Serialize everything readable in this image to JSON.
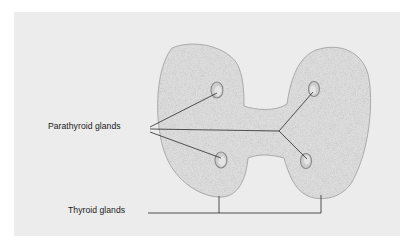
{
  "diagram": {
    "labels": {
      "parathyroid": "Parathyroid glands",
      "thyroid": "Thyroid glands"
    },
    "colors": {
      "background": "#ffffff",
      "panel": "#ececec",
      "lobe_fill": "#dedede",
      "lobe_stroke": "#9a9a9a",
      "parathyroid_fill": "#cfcfcf",
      "parathyroid_stroke": "#8a8a8a",
      "leader_line": "#2a2a2a"
    },
    "structures": [
      {
        "name": "left-thyroid-lobe",
        "type": "thyroid"
      },
      {
        "name": "right-thyroid-lobe",
        "type": "thyroid"
      },
      {
        "name": "isthmus",
        "type": "thyroid"
      },
      {
        "name": "parathyroid-upper-left",
        "type": "parathyroid"
      },
      {
        "name": "parathyroid-upper-right",
        "type": "parathyroid"
      },
      {
        "name": "parathyroid-lower-left",
        "type": "parathyroid"
      },
      {
        "name": "parathyroid-lower-right",
        "type": "parathyroid"
      }
    ]
  }
}
